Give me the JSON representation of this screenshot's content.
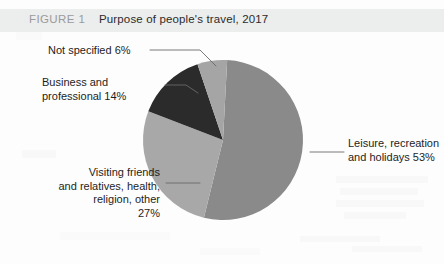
{
  "figure": {
    "number_label": "FIGURE 1",
    "title": "Purpose of people's travel, 2017"
  },
  "chart_data": {
    "type": "pie",
    "title": "Purpose of people's travel, 2017",
    "unit": "percent",
    "total": 100,
    "categories": [
      "Leisure, recreation and holidays",
      "Visiting friends and relatives, health, religion, other",
      "Business and professional",
      "Not specified"
    ],
    "values": [
      53,
      27,
      14,
      6
    ],
    "colors": [
      "#8a8a8a",
      "#a8a8a8",
      "#2b2b2b",
      "#a5a5a5"
    ],
    "start_angle_deg": 3,
    "direction": "clockwise",
    "legend": "none",
    "data_labels": "external callouts with leader lines",
    "slices": [
      {
        "name": "Leisure, recreation and holidays",
        "value": 53,
        "color": "#8a8a8a",
        "label_lines": [
          "Leisure, recreation",
          "and holidays 53%"
        ],
        "label_side": "right"
      },
      {
        "name": "Visiting friends and relatives, health, religion, other",
        "value": 27,
        "color": "#a8a8a8",
        "label_lines": [
          "Visiting friends",
          "and relatives, health,",
          "religion, other",
          "27%"
        ],
        "label_side": "left"
      },
      {
        "name": "Business and professional",
        "value": 14,
        "color": "#2b2b2b",
        "label_lines": [
          "Business and",
          "professional 14%"
        ],
        "label_side": "left"
      },
      {
        "name": "Not specified",
        "value": 6,
        "color": "#a5a5a5",
        "label_lines": [
          "Not specified 6%"
        ],
        "label_side": "left"
      }
    ]
  },
  "labels": {
    "not_specified": "Not specified 6%",
    "business_line1": "Business and",
    "business_line2": "professional 14%",
    "visiting_line1": "Visiting friends",
    "visiting_line2": "and relatives, health,",
    "visiting_line3": "religion, other",
    "visiting_line4": "27%",
    "leisure_line1": "Leisure, recreation",
    "leisure_line2": "and holidays 53%"
  }
}
